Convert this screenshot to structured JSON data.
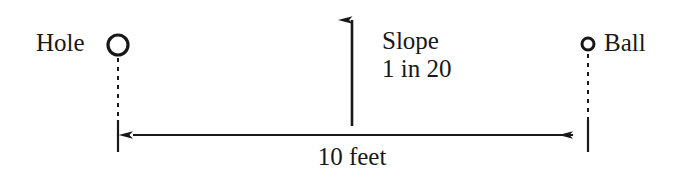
{
  "figure": {
    "background_color": "#ffffff",
    "ink_color": "#181818"
  },
  "labels": {
    "hole": "Hole",
    "ball": "Ball",
    "slope_title": "Slope",
    "slope_ratio": "1 in 20",
    "distance": "10 feet"
  },
  "markers": {
    "hole_marker": {
      "shape": "circle-outline",
      "center_x": 118,
      "center_y": 45,
      "radius": 10,
      "stroke_width": 3.2
    },
    "ball_marker": {
      "shape": "circle-outline",
      "center_x": 588,
      "center_y": 44,
      "radius": 6,
      "stroke_width": 3.0
    }
  },
  "geometry": {
    "slope_arrow": {
      "direction": "up",
      "x": 352,
      "y_tail": 126,
      "y_head": 5
    },
    "dimension_line": {
      "y": 135,
      "x_left": 120,
      "x_right": 586,
      "arrowheads": "both"
    },
    "extension_ticks": [
      {
        "x": 118,
        "y_top": 120,
        "y_bottom": 152
      },
      {
        "x": 588,
        "y_top": 120,
        "y_bottom": 152
      }
    ],
    "leader_dashes": [
      {
        "x": 118,
        "y_top": 58,
        "y_bottom": 120
      },
      {
        "x": 588,
        "y_top": 54,
        "y_bottom": 120
      }
    ]
  }
}
